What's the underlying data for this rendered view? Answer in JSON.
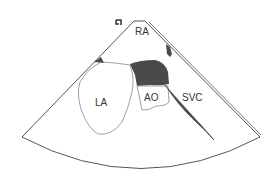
{
  "diagram": {
    "type": "echocardiogram-sector-view",
    "labels": {
      "ra": "RA",
      "la": "LA",
      "ao": "AO",
      "svc": "SVC"
    },
    "colors": {
      "outline": "#555555",
      "thin_outline": "#888888",
      "dark_fill": "#4a4a4a",
      "background": "#ffffff"
    }
  }
}
